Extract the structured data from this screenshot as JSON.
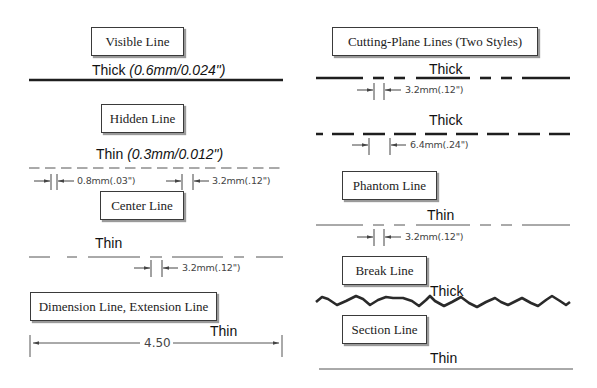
{
  "left_column": {
    "visible": {
      "box_label": "Visible Line",
      "weight": "Thick",
      "spec": "(0.6mm/0.024\")"
    },
    "hidden": {
      "box_label": "Hidden Line",
      "weight": "Thin",
      "spec": "(0.3mm/0.012\")",
      "dim_gap": "0.8mm(.03\")",
      "dim_dash": "3.2mm(.12\")"
    },
    "center": {
      "box_label": "Center Line",
      "weight": "Thin",
      "dim_gap": "3.2mm(.12\")"
    },
    "dimension": {
      "box_label": "Dimension Line, Extension Line",
      "weight": "Thin",
      "value": "4.50"
    }
  },
  "right_column": {
    "cutting_plane": {
      "box_label": "Cutting-Plane Lines (Two Styles)",
      "style1_weight": "Thick",
      "style1_dim": "3.2mm(.12\")",
      "style2_weight": "Thick",
      "style2_dim": "6.4mm(.24\")"
    },
    "phantom": {
      "box_label": "Phantom Line",
      "weight": "Thin",
      "dim_gap": "3.2mm(.12\")"
    },
    "break": {
      "box_label": "Break Line",
      "weight": "Thick"
    },
    "section": {
      "box_label": "Section Line",
      "weight": "Thin"
    }
  },
  "colors": {
    "line": "#1e1e1e",
    "thin_line": "#555555",
    "box_border": "#3a3a3a",
    "background": "#ffffff"
  }
}
